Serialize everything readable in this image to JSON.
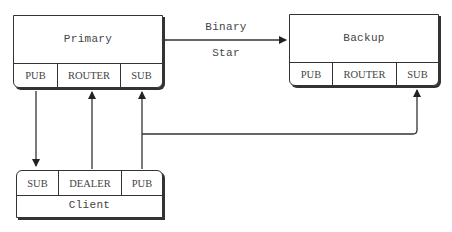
{
  "diagram": {
    "link_label_top": "Binary",
    "link_label_bottom": "Star",
    "nodes": {
      "primary": {
        "title": "Primary",
        "sockets": [
          "PUB",
          "ROUTER",
          "SUB"
        ]
      },
      "backup": {
        "title": "Backup",
        "sockets": [
          "PUB",
          "ROUTER",
          "SUB"
        ]
      },
      "client": {
        "title": "Client",
        "sockets": [
          "SUB",
          "DEALER",
          "PUB"
        ]
      }
    },
    "edges": [
      {
        "from": "primary",
        "to": "backup",
        "label": "Binary Star",
        "direction": "bidirectional"
      },
      {
        "from": "primary.PUB",
        "to": "client.SUB"
      },
      {
        "from": "client.DEALER",
        "to": "primary.ROUTER"
      },
      {
        "from": "client.PUB",
        "to": "primary.SUB"
      },
      {
        "from": "client.PUB",
        "to": "backup.SUB"
      }
    ],
    "colors": {
      "line": "#333333",
      "text": "#444444",
      "background": "#ffffff"
    }
  }
}
